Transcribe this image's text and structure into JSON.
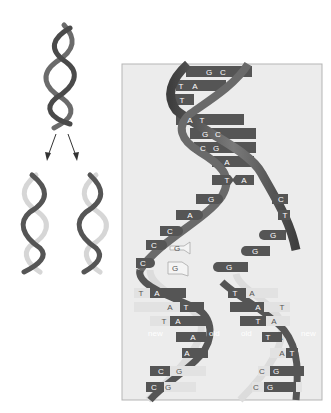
{
  "diagram": {
    "overview": {
      "parent_helix": "parent DNA double helix",
      "daughter_helices": [
        "daughter helix left",
        "daughter helix right"
      ],
      "arrows": 2
    },
    "detail_panel": {
      "parent_pairs": [
        {
          "left": "G",
          "right": "C"
        },
        {
          "left": "T",
          "right": "A"
        },
        {
          "left": "T",
          "right": ""
        },
        {
          "left": "A",
          "right": "T"
        },
        {
          "left": "G",
          "right": "C"
        },
        {
          "left": "C",
          "right": "G"
        },
        {
          "left": "A",
          "right": ""
        }
      ],
      "fork_pair": {
        "left": "T",
        "right": "A"
      },
      "left_unpaired": [
        "G",
        "A",
        "C",
        "C",
        "C"
      ],
      "right_unpaired": [
        "C",
        "T",
        "G",
        "G",
        "G"
      ],
      "free_nucleotides": [
        "G",
        "G"
      ],
      "left_daughter_pairs": [
        {
          "new": "T",
          "old": "A"
        },
        {
          "new": "A",
          "old": "T"
        },
        {
          "new": "T",
          "old": "A"
        },
        {
          "new": "T",
          "old": "A"
        },
        {
          "new": "A",
          "old": "T"
        },
        {
          "new": "C",
          "old": "G"
        },
        {
          "new": "C",
          "old": "G"
        }
      ],
      "right_daughter_pairs": [
        {
          "old": "T",
          "new": "A"
        },
        {
          "old": "A",
          "new": "T"
        },
        {
          "old": "T",
          "new": "A"
        },
        {
          "old": "T",
          "new": "A"
        },
        {
          "old": "A",
          "new": "T"
        },
        {
          "old": "C",
          "new": "G"
        },
        {
          "old": "C",
          "new": "G"
        }
      ],
      "strand_labels": {
        "left_new": "new",
        "left_old": "old",
        "right_old": "old",
        "right_new": "new"
      }
    },
    "colors": {
      "old_strand": "#5a5a5a",
      "new_strand": "#d8d8d8",
      "panel_bg": "#ececec",
      "panel_border": "#b5b5b5"
    }
  }
}
